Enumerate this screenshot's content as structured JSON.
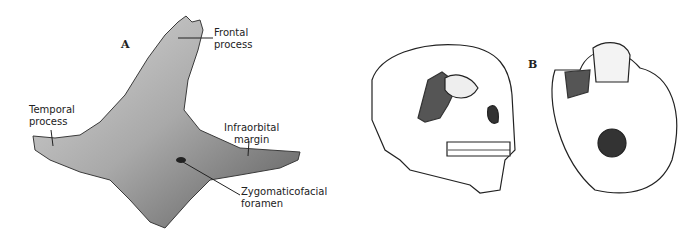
{
  "figure": {
    "panel_a": {
      "letter": "A",
      "subject": "zygomatic-bone",
      "labels": {
        "frontal_process": [
          "Frontal",
          "process"
        ],
        "temporal_process": [
          "Temporal",
          "process"
        ],
        "infraorbital_margin": [
          "Infraorbital",
          "margin"
        ],
        "zygomaticofacial_foramen": [
          "Zygomaticofacial",
          "foramen"
        ]
      }
    },
    "panel_b": {
      "letter": "B",
      "views": [
        "skull-lateral-oblique",
        "skull-inferior"
      ],
      "highlight_color": "#555555"
    }
  }
}
